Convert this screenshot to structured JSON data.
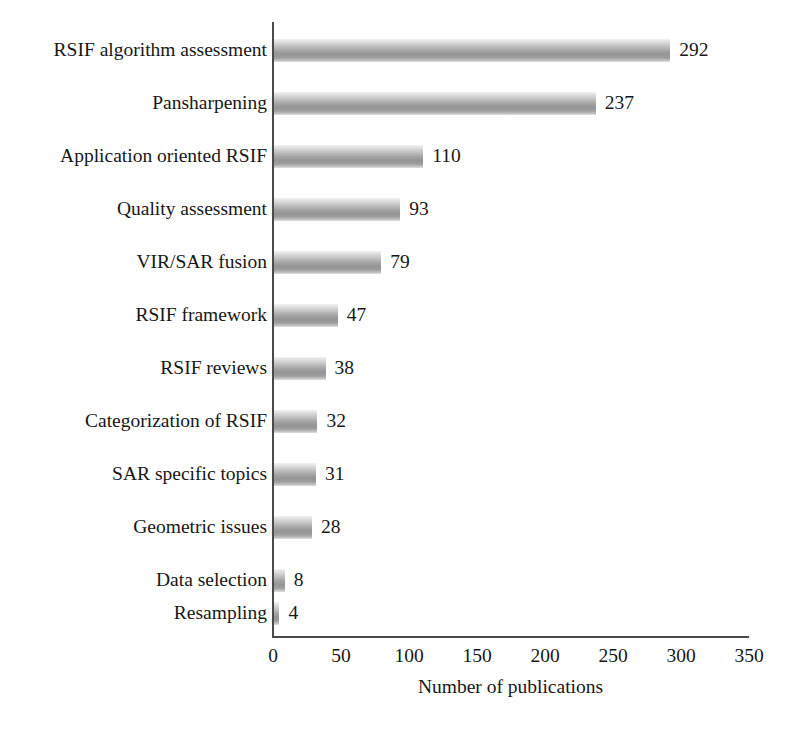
{
  "chart_data": {
    "type": "bar",
    "orientation": "horizontal",
    "title": "",
    "xlabel": "Number of publications",
    "ylabel": "",
    "xlim": [
      0,
      350
    ],
    "xticks": [
      0,
      50,
      100,
      150,
      200,
      250,
      300,
      350
    ],
    "grid": false,
    "legend": null,
    "show_value_labels": true,
    "categories": [
      "RSIF algorithm assessment",
      "Pansharpening",
      "Application oriented RSIF",
      "Quality assessment",
      "VIR/SAR fusion",
      "RSIF framework",
      "RSIF reviews",
      "Categorization of RSIF",
      "SAR specific topics",
      "Geometric issues",
      "Data selection",
      "Resampling"
    ],
    "values": [
      292,
      237,
      110,
      93,
      79,
      47,
      38,
      32,
      31,
      28,
      8,
      4
    ],
    "value_labels": [
      "292",
      "237",
      "110",
      "93",
      "79",
      "47",
      "38",
      "32",
      "31",
      "28",
      "8",
      "4"
    ],
    "bar_color": "#9a9a9a",
    "bar_color_light": "#e8e8e8",
    "axis_color": "#4a4a4a",
    "text_color": "#171717",
    "background": "#ffffff"
  }
}
